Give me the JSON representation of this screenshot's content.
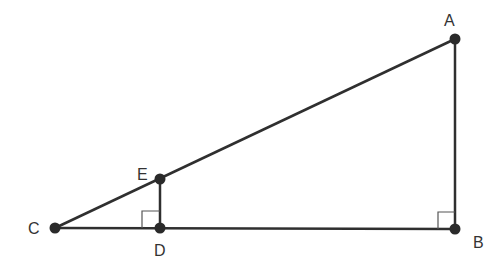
{
  "diagram": {
    "type": "geometry",
    "colors": {
      "line": "#2f2f2f",
      "point": "#2a2a2a",
      "label": "#333333",
      "right_angle_mark": "#555555"
    },
    "points": [
      {
        "id": "A",
        "label": "A",
        "x": 455,
        "y": 39,
        "label_x": 450,
        "label_y": 26
      },
      {
        "id": "B",
        "label": "B",
        "x": 455,
        "y": 229,
        "label_x": 473,
        "label_y": 248
      },
      {
        "id": "C",
        "label": "C",
        "x": 55,
        "y": 228,
        "label_x": 28,
        "label_y": 234
      },
      {
        "id": "D",
        "label": "D",
        "x": 160,
        "y": 228,
        "label_x": 155,
        "label_y": 256
      },
      {
        "id": "E",
        "label": "E",
        "x": 160,
        "y": 179,
        "label_x": 138,
        "label_y": 179
      }
    ],
    "segments": [
      {
        "from": "C",
        "to": "A"
      },
      {
        "from": "A",
        "to": "B"
      },
      {
        "from": "C",
        "to": "B"
      },
      {
        "from": "E",
        "to": "D"
      }
    ],
    "right_angles": [
      {
        "at": "D"
      },
      {
        "at": "B"
      }
    ]
  }
}
